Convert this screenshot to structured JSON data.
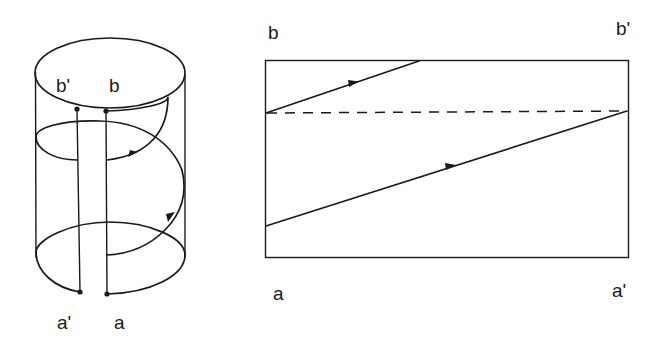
{
  "figure": {
    "left_panel": {
      "name": "helical path on cylinder",
      "labels": {
        "top_left": "b'",
        "top_right": "b",
        "bottom_left": "a'",
        "bottom_right": "a"
      }
    },
    "right_panel": {
      "name": "unrolled rectangle with straight-line path",
      "labels": {
        "top_left": "b",
        "top_right": "b'",
        "bottom_left": "a",
        "bottom_right": "a'"
      },
      "lines": {
        "dashed": "horizontal dashed line",
        "upper_segment": "directed segment (arrow)",
        "lower_segment": "directed segment (arrow)"
      }
    },
    "colors": {
      "ink": "#1a1a1a",
      "background": "#ffffff"
    }
  }
}
